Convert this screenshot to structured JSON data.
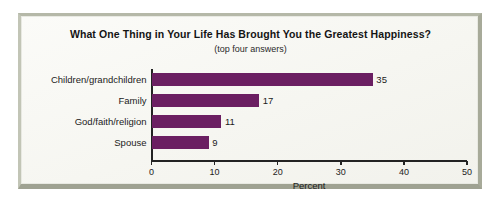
{
  "chart_data": {
    "type": "bar",
    "orientation": "horizontal",
    "title": "What One Thing in Your Life Has Brought You the Greatest Happiness?",
    "subtitle": "(top four answers)",
    "categories": [
      "Children/grandchildren",
      "Family",
      "God/faith/religion",
      "Spouse"
    ],
    "values": [
      35,
      17,
      11,
      9
    ],
    "value_labels": [
      "35",
      "17",
      "11",
      "9"
    ],
    "xlabel": "Percent",
    "ylabel": "",
    "xlim": [
      0,
      50
    ],
    "xticks": [
      0,
      10,
      20,
      30,
      40,
      50
    ],
    "xtick_labels": [
      "0",
      "10",
      "20",
      "30",
      "40",
      "50"
    ],
    "grid": false,
    "legend": false,
    "bar_color": "#6b1f62",
    "background_color": "#f8f8f4",
    "frame_color": "#a7aa99",
    "axis_color": "#232323"
  }
}
